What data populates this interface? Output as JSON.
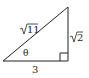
{
  "diagram": {
    "type": "right-triangle",
    "vertices": {
      "left": [
        3,
        61
      ],
      "right_angle": [
        68,
        61
      ],
      "top": [
        68,
        7
      ]
    },
    "labels": {
      "hypotenuse": "11",
      "hypotenuse_display": "√11",
      "vertical_leg": "2",
      "vertical_leg_display": "√2",
      "horizontal_leg": "3",
      "angle": "θ"
    },
    "right_angle_marker": true,
    "stroke_color": "#222222"
  }
}
